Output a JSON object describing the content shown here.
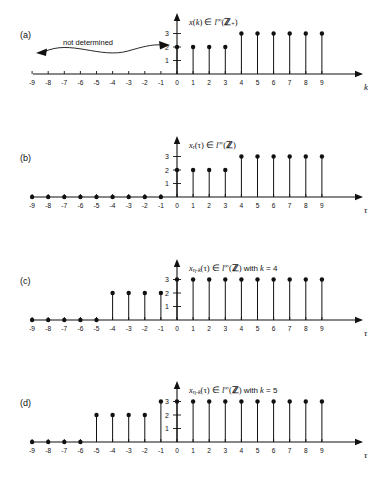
{
  "figure": {
    "background": "#ffffff",
    "ink": "#111111",
    "panels": [
      {
        "id": "a",
        "label": "(a)",
        "axis_title_html": "<span class=\"it\">x</span>(<span class=\"it\">k</span>) ∈ <span class=\"it\">l</span><span class=\"sup\">∞</span>(<span class=\"bb\">ℤ</span><span class=\"sub\">+</span>)",
        "axis_title_text": "x(k) ∈ l∞(ℤ+)",
        "x_axis_var": "k",
        "y_ticks": [
          1,
          2,
          3
        ],
        "x_ticks": [
          -9,
          -8,
          -7,
          -6,
          -5,
          -4,
          -3,
          -2,
          -1,
          0,
          1,
          2,
          3,
          4,
          5,
          6,
          7,
          8,
          9
        ],
        "annotation": "not determined",
        "has_wavy_arrow": true,
        "points": [
          {
            "x": 0,
            "y": 2
          },
          {
            "x": 1,
            "y": 2
          },
          {
            "x": 2,
            "y": 2
          },
          {
            "x": 3,
            "y": 2
          },
          {
            "x": 4,
            "y": 3
          },
          {
            "x": 5,
            "y": 3
          },
          {
            "x": 6,
            "y": 3
          },
          {
            "x": 7,
            "y": 3
          },
          {
            "x": 8,
            "y": 3
          },
          {
            "x": 9,
            "y": 3
          }
        ]
      },
      {
        "id": "b",
        "label": "(b)",
        "axis_title_html": "<span class=\"it\">x</span><span class=\"sub\">r</span>(τ) ∈ <span class=\"it\">l</span><span class=\"sup\">∞</span>(<span class=\"bb\">ℤ</span>)",
        "axis_title_text": "x_r(τ) ∈ l∞(ℤ)",
        "x_axis_var": "τ",
        "y_ticks": [
          1,
          2,
          3
        ],
        "x_ticks": [
          -9,
          -8,
          -7,
          -6,
          -5,
          -4,
          -3,
          -2,
          -1,
          0,
          1,
          2,
          3,
          4,
          5,
          6,
          7,
          8,
          9
        ],
        "annotation": "",
        "has_wavy_arrow": false,
        "points": [
          {
            "x": -9,
            "y": 0
          },
          {
            "x": -8,
            "y": 0
          },
          {
            "x": -7,
            "y": 0
          },
          {
            "x": -6,
            "y": 0
          },
          {
            "x": -5,
            "y": 0
          },
          {
            "x": -4,
            "y": 0
          },
          {
            "x": -3,
            "y": 0
          },
          {
            "x": -2,
            "y": 0
          },
          {
            "x": -1,
            "y": 0
          },
          {
            "x": 0,
            "y": 2
          },
          {
            "x": 1,
            "y": 2
          },
          {
            "x": 2,
            "y": 2
          },
          {
            "x": 3,
            "y": 2
          },
          {
            "x": 4,
            "y": 3
          },
          {
            "x": 5,
            "y": 3
          },
          {
            "x": 6,
            "y": 3
          },
          {
            "x": 7,
            "y": 3
          },
          {
            "x": 8,
            "y": 3
          },
          {
            "x": 9,
            "y": 3
          }
        ]
      },
      {
        "id": "c",
        "label": "(c)",
        "axis_title_html": "<span class=\"it\">x</span><span class=\"sub\">η-<span class=\"it\">k</span></span>(τ) ∈ <span class=\"it\">l</span><span class=\"sup\">∞</span>(<span class=\"bb\">ℤ</span>) <span class=\"rm\">with</span> <span class=\"it\">k</span> <span class=\"rm\">= 4</span>",
        "axis_title_text": "x_{η-k}(τ) ∈ l∞(ℤ) with k = 4",
        "x_axis_var": "τ",
        "y_ticks": [
          1,
          2,
          3
        ],
        "x_ticks": [
          -9,
          -8,
          -7,
          -6,
          -5,
          -4,
          -3,
          -2,
          -1,
          0,
          1,
          2,
          3,
          4,
          5,
          6,
          7,
          8,
          9
        ],
        "annotation": "",
        "has_wavy_arrow": false,
        "points": [
          {
            "x": -9,
            "y": 0
          },
          {
            "x": -8,
            "y": 0
          },
          {
            "x": -7,
            "y": 0
          },
          {
            "x": -6,
            "y": 0
          },
          {
            "x": -5,
            "y": 0
          },
          {
            "x": -4,
            "y": 2
          },
          {
            "x": -3,
            "y": 2
          },
          {
            "x": -2,
            "y": 2
          },
          {
            "x": -1,
            "y": 2
          },
          {
            "x": 0,
            "y": 3
          },
          {
            "x": 1,
            "y": 3
          },
          {
            "x": 2,
            "y": 3
          },
          {
            "x": 3,
            "y": 3
          },
          {
            "x": 4,
            "y": 3
          },
          {
            "x": 5,
            "y": 3
          },
          {
            "x": 6,
            "y": 3
          },
          {
            "x": 7,
            "y": 3
          },
          {
            "x": 8,
            "y": 3
          },
          {
            "x": 9,
            "y": 3
          }
        ]
      },
      {
        "id": "d",
        "label": "(d)",
        "axis_title_html": "<span class=\"it\">x</span><span class=\"sub\">η-<span class=\"it\">k</span></span>(τ) ∈ <span class=\"it\">l</span><span class=\"sup\">∞</span>(<span class=\"bb\">ℤ</span>) <span class=\"rm\">with</span> <span class=\"it\">k</span> <span class=\"rm\">= 5</span>",
        "axis_title_text": "x_{η-k}(τ) ∈ l∞(ℤ) with k = 5",
        "x_axis_var": "τ",
        "y_ticks": [
          1,
          2,
          3
        ],
        "x_ticks": [
          -9,
          -8,
          -7,
          -6,
          -5,
          -4,
          -3,
          -2,
          -1,
          0,
          1,
          2,
          3,
          4,
          5,
          6,
          7,
          8,
          9
        ],
        "annotation": "",
        "has_wavy_arrow": false,
        "points": [
          {
            "x": -9,
            "y": 0
          },
          {
            "x": -8,
            "y": 0
          },
          {
            "x": -7,
            "y": 0
          },
          {
            "x": -6,
            "y": 0
          },
          {
            "x": -5,
            "y": 2
          },
          {
            "x": -4,
            "y": 2
          },
          {
            "x": -3,
            "y": 2
          },
          {
            "x": -2,
            "y": 2
          },
          {
            "x": -1,
            "y": 3
          },
          {
            "x": 0,
            "y": 3
          },
          {
            "x": 1,
            "y": 3
          },
          {
            "x": 2,
            "y": 3
          },
          {
            "x": 3,
            "y": 3
          },
          {
            "x": 4,
            "y": 3
          },
          {
            "x": 5,
            "y": 3
          },
          {
            "x": 6,
            "y": 3
          },
          {
            "x": 7,
            "y": 3
          },
          {
            "x": 8,
            "y": 3
          },
          {
            "x": 9,
            "y": 3
          }
        ]
      }
    ]
  },
  "chart_data": [
    {
      "type": "scatter",
      "title": "x(k) ∈ l∞(ℤ+)",
      "subtitle": "(a)",
      "xlabel": "k",
      "ylabel": "",
      "x": [
        0,
        1,
        2,
        3,
        4,
        5,
        6,
        7,
        8,
        9
      ],
      "values": [
        2,
        2,
        2,
        2,
        3,
        3,
        3,
        3,
        3,
        3
      ],
      "xlim": [
        -10,
        10
      ],
      "ylim": [
        0,
        3.6
      ],
      "xticks": [
        -9,
        -8,
        -7,
        -6,
        -5,
        -4,
        -3,
        -2,
        -1,
        0,
        1,
        2,
        3,
        4,
        5,
        6,
        7,
        8,
        9
      ],
      "yticks": [
        1,
        2,
        3
      ],
      "grid": false,
      "legend": "none",
      "annotations": [
        "not determined"
      ],
      "note": "Stem plot; samples only defined for k >= 0, region k < 0 marked 'not determined' with a double headed wavy arrow."
    },
    {
      "type": "scatter",
      "title": "x_r(τ) ∈ l∞(ℤ)",
      "subtitle": "(b)",
      "xlabel": "τ",
      "ylabel": "",
      "x": [
        -9,
        -8,
        -7,
        -6,
        -5,
        -4,
        -3,
        -2,
        -1,
        0,
        1,
        2,
        3,
        4,
        5,
        6,
        7,
        8,
        9
      ],
      "values": [
        0,
        0,
        0,
        0,
        0,
        0,
        0,
        0,
        0,
        2,
        2,
        2,
        2,
        3,
        3,
        3,
        3,
        3,
        3
      ],
      "xlim": [
        -10,
        10
      ],
      "ylim": [
        0,
        3.6
      ],
      "xticks": [
        -9,
        -8,
        -7,
        -6,
        -5,
        -4,
        -3,
        -2,
        -1,
        0,
        1,
        2,
        3,
        4,
        5,
        6,
        7,
        8,
        9
      ],
      "yticks": [
        1,
        2,
        3
      ],
      "grid": false,
      "legend": "none",
      "annotations": [],
      "note": "Zero-extended signal: zero for τ < 0."
    },
    {
      "type": "scatter",
      "title": "x_{η-k}(τ) ∈ l∞(ℤ) with k = 4",
      "subtitle": "(c)",
      "xlabel": "τ",
      "ylabel": "",
      "x": [
        -9,
        -8,
        -7,
        -6,
        -5,
        -4,
        -3,
        -2,
        -1,
        0,
        1,
        2,
        3,
        4,
        5,
        6,
        7,
        8,
        9
      ],
      "values": [
        0,
        0,
        0,
        0,
        0,
        2,
        2,
        2,
        2,
        3,
        3,
        3,
        3,
        3,
        3,
        3,
        3,
        3,
        3
      ],
      "xlim": [
        -10,
        10
      ],
      "ylim": [
        0,
        3.6
      ],
      "xticks": [
        -9,
        -8,
        -7,
        -6,
        -5,
        -4,
        -3,
        -2,
        -1,
        0,
        1,
        2,
        3,
        4,
        5,
        6,
        7,
        8,
        9
      ],
      "yticks": [
        1,
        2,
        3
      ],
      "grid": false,
      "legend": "none",
      "annotations": [],
      "note": "Signal shifted left by 4 samples."
    },
    {
      "type": "scatter",
      "title": "x_{η-k}(τ) ∈ l∞(ℤ) with k = 5",
      "subtitle": "(d)",
      "xlabel": "τ",
      "ylabel": "",
      "x": [
        -9,
        -8,
        -7,
        -6,
        -5,
        -4,
        -3,
        -2,
        -1,
        0,
        1,
        2,
        3,
        4,
        5,
        6,
        7,
        8,
        9
      ],
      "values": [
        0,
        0,
        0,
        0,
        2,
        2,
        2,
        2,
        3,
        3,
        3,
        3,
        3,
        3,
        3,
        3,
        3,
        3,
        3
      ],
      "xlim": [
        -10,
        10
      ],
      "ylim": [
        0,
        3.6
      ],
      "xticks": [
        -9,
        -8,
        -7,
        -6,
        -5,
        -4,
        -3,
        -2,
        -1,
        0,
        1,
        2,
        3,
        4,
        5,
        6,
        7,
        8,
        9
      ],
      "yticks": [
        1,
        2,
        3
      ],
      "grid": false,
      "legend": "none",
      "annotations": [],
      "note": "Signal shifted left by 5 samples."
    }
  ]
}
